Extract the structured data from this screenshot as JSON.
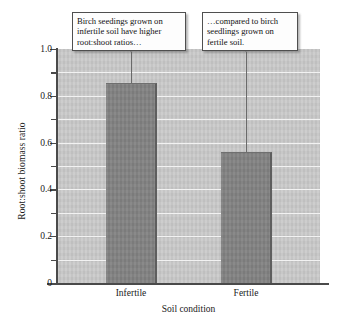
{
  "chart_data": {
    "type": "bar",
    "title": "",
    "categories": [
      "Infertile",
      "Fertile"
    ],
    "values": [
      0.855,
      0.56
    ],
    "xlabel": "Soil condition",
    "ylabel": "Root:shoot biomass ratio",
    "ylim": [
      0,
      1.0
    ],
    "yticks": [
      "0",
      "0.2",
      "0.4",
      "0.6",
      "0.8",
      "1.0"
    ],
    "ytick_values": [
      0,
      0.2,
      0.4,
      0.6,
      0.8,
      1.0
    ],
    "minor_ticks": [
      0.1,
      0.3,
      0.5,
      0.7,
      0.9
    ],
    "grid": true,
    "grid_color": "#f2f2f2",
    "plot_background": "#c9c9c9",
    "bar_color": "#828282",
    "axis_color": "#4a4a4a",
    "legend": null,
    "annotations": [
      {
        "name": "callout-infertile",
        "text": "Birch seedings grown on infertile soil have higher root:shoot ratios…",
        "points_to": "Infertile"
      },
      {
        "name": "callout-fertile",
        "text": "…compared to birch seedlings grown on fertile soil.",
        "points_to": "Fertile"
      }
    ]
  }
}
